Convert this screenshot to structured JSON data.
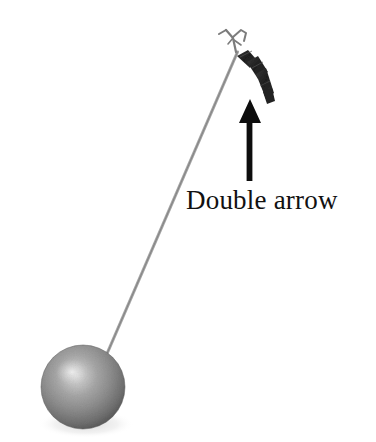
{
  "figure": {
    "kind": "pendulum-diagram",
    "background_color": "#ffffff",
    "width": 376,
    "height": 442
  },
  "annotation": {
    "label": "Double arrow",
    "label_color": "#111111",
    "label_font_size_px": 27,
    "arrow_color": "#0d0d0d",
    "arrow_direction": "up",
    "arrow_tip": {
      "x": 250,
      "y": 99
    },
    "arrow_tail": {
      "x": 248,
      "y": 181
    }
  },
  "parts": {
    "hook": {
      "name": "support-hook",
      "color": "#8a8a8a",
      "x": 218,
      "y": 27,
      "width": 30,
      "height": 25
    },
    "clip": {
      "name": "double-arrow-clip",
      "color": "#2b2b2b",
      "from": {
        "x": 240,
        "y": 55
      },
      "to": {
        "x": 272,
        "y": 102
      }
    },
    "string": {
      "name": "pendulum-string",
      "color": "#9a9a9a",
      "from": {
        "x": 237,
        "y": 52
      },
      "to": {
        "x": 106,
        "y": 356
      }
    },
    "bob": {
      "name": "pendulum-bob",
      "center": {
        "x": 83,
        "y": 387
      },
      "radius": 42,
      "highlight_color": "#d8d8d8",
      "mid_color": "#9c9c9c",
      "edge_color": "#4f4f4f",
      "shadow_color": "#c9c9c9"
    }
  }
}
